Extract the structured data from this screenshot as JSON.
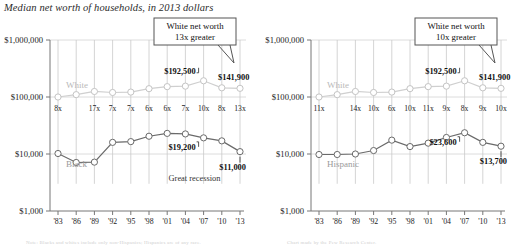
{
  "figure": {
    "title": "Median net worth of households, in 2013 dollars",
    "caption_left": "Note: Blacks and whites include only non-Hispanics; Hispanics are of any race.",
    "caption_right": "Chart made by the Pew Research Center."
  },
  "axis": {
    "y_ticks": [
      "$1,000,000",
      "$100,000",
      "$10,000",
      "$1,000"
    ],
    "y_values": [
      1000000,
      100000,
      10000,
      1000
    ],
    "x_ticks": [
      "'83",
      "'86",
      "'89",
      "'92",
      "'95",
      "'98",
      "'01",
      "'04",
      "'07",
      "'10",
      "'13"
    ]
  },
  "chart_data": [
    {
      "type": "line",
      "panel": "left",
      "title": "Median net worth of households, in 2013 dollars",
      "xlabel": "",
      "ylabel": "",
      "yscale": "log",
      "ylim": [
        1000,
        1000000
      ],
      "grid": true,
      "legend": "inline-labels",
      "x": [
        "'83",
        "'86",
        "'89",
        "'92",
        "'95",
        "'98",
        "'01",
        "'04",
        "'07",
        "'10",
        "'13"
      ],
      "series": [
        {
          "name": "White",
          "label": "White",
          "color": "#cfcfcf",
          "values": [
            100000,
            110000,
            125000,
            120000,
            122000,
            140000,
            152000,
            155000,
            192500,
            145000,
            141900
          ]
        },
        {
          "name": "Black",
          "label": "Black",
          "color": "#6a6a6a",
          "values": [
            10200,
            7100,
            7200,
            16000,
            16500,
            20500,
            23000,
            22500,
            19200,
            17000,
            11000
          ]
        }
      ],
      "ratio_labels": [
        "8x",
        "",
        "17x",
        "7x",
        "7x",
        "6x",
        "6x",
        "7x",
        "10x",
        "8x",
        "13x"
      ],
      "annotations": [
        {
          "text": "$192,500",
          "series": "White",
          "x": "'07"
        },
        {
          "text": "$141,900",
          "series": "White",
          "x": "'13"
        },
        {
          "text": "$19,200",
          "series": "Black",
          "x": "'07"
        },
        {
          "text": "$11,000",
          "series": "Black",
          "x": "'13"
        },
        {
          "text": "Great recession",
          "kind": "note"
        }
      ],
      "callout": {
        "line1": "White net worth",
        "line2": "13x greater"
      }
    },
    {
      "type": "line",
      "panel": "right",
      "title": "",
      "xlabel": "",
      "ylabel": "",
      "yscale": "log",
      "ylim": [
        1000,
        1000000
      ],
      "grid": true,
      "legend": "inline-labels",
      "x": [
        "'83",
        "'86",
        "'89",
        "'92",
        "'95",
        "'98",
        "'01",
        "'04",
        "'07",
        "'10",
        "'13"
      ],
      "series": [
        {
          "name": "White",
          "label": "White",
          "color": "#cfcfcf",
          "values": [
            100000,
            110000,
            125000,
            120000,
            122000,
            140000,
            152000,
            155000,
            192500,
            145000,
            141900
          ]
        },
        {
          "name": "Hispanic",
          "label": "Hispanic",
          "color": "#6a6a6a",
          "values": [
            9800,
            9800,
            10000,
            11500,
            17500,
            13500,
            15500,
            19500,
            23600,
            16000,
            13700
          ]
        }
      ],
      "ratio_labels": [
        "11x",
        "",
        "14x",
        "10x",
        "6x",
        "10x",
        "11x",
        "9x",
        "8x",
        "9x",
        "10x"
      ],
      "annotations": [
        {
          "text": "$192,500",
          "series": "White",
          "x": "'07"
        },
        {
          "text": "$141,900",
          "series": "White",
          "x": "'13"
        },
        {
          "text": "$23,600",
          "series": "Hispanic",
          "x": "'07"
        },
        {
          "text": "$13,700",
          "series": "Hispanic",
          "x": "'13"
        }
      ],
      "callout": {
        "line1": "White net worth",
        "line2": "10x greater"
      }
    }
  ],
  "colors": {
    "white_series": "#cfcfcf",
    "dark_series": "#6a6a6a",
    "grid": "#dcdcdc",
    "axis": "#777777"
  }
}
